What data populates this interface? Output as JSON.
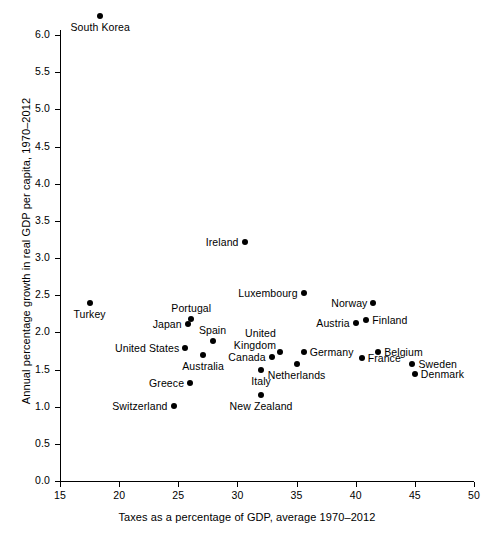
{
  "chart_data": {
    "type": "scatter",
    "title": "",
    "xlabel": "Taxes as a percentage of GDP, average 1970–2012",
    "ylabel": "Annual percentage growth in real GDP per capita, 1970–2012",
    "xlim": [
      15,
      50
    ],
    "ylim": [
      0.0,
      6.4
    ],
    "xticks": [
      "15",
      "20",
      "25",
      "30",
      "35",
      "40",
      "45",
      "50"
    ],
    "xtick_values": [
      15,
      20,
      25,
      30,
      35,
      40,
      45,
      50
    ],
    "yticks": [
      "0.0",
      "0.5",
      "1.0",
      "1.5",
      "2.0",
      "2.5",
      "3.0",
      "3.5",
      "4.0",
      "4.5",
      "5.0",
      "5.5",
      "6.0"
    ],
    "ytick_values": [
      0.0,
      0.5,
      1.0,
      1.5,
      2.0,
      2.5,
      3.0,
      3.5,
      4.0,
      4.5,
      5.0,
      5.5,
      6.0
    ],
    "grid": false,
    "legend": "none",
    "marker": "filled-circle",
    "marker_color": "#000000",
    "points": [
      {
        "label": "South Korea",
        "x": 18.4,
        "y": 6.25,
        "label_pos": "below"
      },
      {
        "label": "Ireland",
        "x": 30.6,
        "y": 3.21,
        "label_pos": "left"
      },
      {
        "label": "Luxembourg",
        "x": 35.6,
        "y": 2.53,
        "label_pos": "left"
      },
      {
        "label": "Turkey",
        "x": 17.5,
        "y": 2.4,
        "label_pos": "below"
      },
      {
        "label": "Norway",
        "x": 41.5,
        "y": 2.4,
        "label_pos": "left"
      },
      {
        "label": "Portugal",
        "x": 26.1,
        "y": 2.18,
        "label_pos": "above"
      },
      {
        "label": "Finland",
        "x": 40.9,
        "y": 2.17,
        "label_pos": "right"
      },
      {
        "label": "Austria",
        "x": 40.0,
        "y": 2.13,
        "label_pos": "left"
      },
      {
        "label": "Japan",
        "x": 25.8,
        "y": 2.11,
        "label_pos": "left"
      },
      {
        "label": "Spain",
        "x": 27.9,
        "y": 1.89,
        "label_pos": "above"
      },
      {
        "label": "United States",
        "x": 25.6,
        "y": 1.79,
        "label_pos": "left"
      },
      {
        "label": "United Kingdom",
        "x": 33.6,
        "y": 1.74,
        "label_pos": "above-left"
      },
      {
        "label": "Germany",
        "x": 35.6,
        "y": 1.74,
        "label_pos": "right"
      },
      {
        "label": "Belgium",
        "x": 41.9,
        "y": 1.74,
        "label_pos": "right"
      },
      {
        "label": "Australia",
        "x": 27.1,
        "y": 1.69,
        "label_pos": "below"
      },
      {
        "label": "Canada",
        "x": 32.9,
        "y": 1.67,
        "label_pos": "left"
      },
      {
        "label": "France",
        "x": 40.5,
        "y": 1.65,
        "label_pos": "right"
      },
      {
        "label": "Sweden",
        "x": 44.8,
        "y": 1.58,
        "label_pos": "right"
      },
      {
        "label": "Netherlands",
        "x": 35.0,
        "y": 1.58,
        "label_pos": "below"
      },
      {
        "label": "Italy",
        "x": 32.0,
        "y": 1.5,
        "label_pos": "below"
      },
      {
        "label": "Denmark",
        "x": 45.0,
        "y": 1.44,
        "label_pos": "right"
      },
      {
        "label": "Greece",
        "x": 26.0,
        "y": 1.32,
        "label_pos": "left"
      },
      {
        "label": "New Zealand",
        "x": 32.0,
        "y": 1.16,
        "label_pos": "below"
      },
      {
        "label": "Switzerland",
        "x": 24.6,
        "y": 1.01,
        "label_pos": "left"
      }
    ]
  }
}
